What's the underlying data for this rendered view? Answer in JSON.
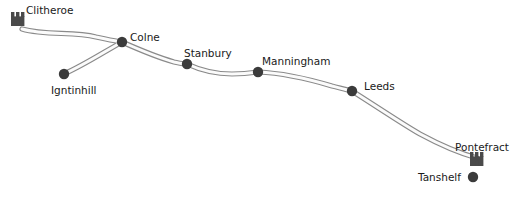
{
  "map": {
    "title": "Route map",
    "background_color": "#ffffff",
    "road_color": "#8a8a8a",
    "road_fill_color": "#fbfbfb",
    "node_color": "#3b3b3b",
    "label_color": "#1a1a1a",
    "castle_color": "#4a4a4a",
    "places": [
      {
        "id": "clitheroe",
        "label": "Clitheroe",
        "marker": "castle-icon",
        "x": 20,
        "y": 26,
        "label_x": 26,
        "label_y": 14
      },
      {
        "id": "colne",
        "label": "Colne",
        "marker": "node-dot",
        "x": 122,
        "y": 42,
        "label_x": 130,
        "label_y": 41
      },
      {
        "id": "igntinhill",
        "label": "Igntinhill",
        "marker": "node-dot",
        "x": 64,
        "y": 74,
        "label_x": 51,
        "label_y": 94
      },
      {
        "id": "stanbury",
        "label": "Stanbury",
        "marker": "node-dot",
        "x": 187,
        "y": 64,
        "label_x": 184,
        "label_y": 57
      },
      {
        "id": "manningham",
        "label": "Manningham",
        "marker": "node-dot",
        "x": 258,
        "y": 72,
        "label_x": 262,
        "label_y": 65
      },
      {
        "id": "leeds",
        "label": "Leeds",
        "marker": "node-dot",
        "x": 352,
        "y": 91,
        "label_x": 364,
        "label_y": 90
      },
      {
        "id": "pontefract",
        "label": "Pontefract",
        "marker": "castle-icon",
        "x": 478,
        "y": 159,
        "label_x": 455,
        "label_y": 151
      },
      {
        "id": "tanshelf",
        "label": "Tanshelf",
        "marker": "node-dot",
        "x": 473,
        "y": 177,
        "label_x": 418,
        "label_y": 180
      }
    ],
    "roads": [
      {
        "id": "clitheroe-colne",
        "from": "clitheroe",
        "to": "colne",
        "path": "M 22 29 C 46 36, 74 31, 96 37 C 106 39, 114 41, 122 42"
      },
      {
        "id": "igntinhill-colne",
        "from": "igntinhill",
        "to": "colne",
        "path": "M 64 74 C 84 65, 104 52, 122 42"
      },
      {
        "id": "colne-stanbury",
        "from": "colne",
        "to": "stanbury",
        "path": "M 122 42 C 140 50, 160 58, 174 62 C 179 63, 183 64, 187 64"
      },
      {
        "id": "stanbury-manningham",
        "from": "stanbury",
        "to": "manningham",
        "path": "M 187 64 C 200 70, 216 74, 232 74 C 243 74, 251 73, 258 72"
      },
      {
        "id": "manningham-leeds",
        "from": "manningham",
        "to": "leeds",
        "path": "M 258 72 C 282 73, 312 80, 332 86 C 340 88, 347 90, 352 91"
      },
      {
        "id": "leeds-pontefract",
        "from": "leeds",
        "to": "pontefract",
        "path": "M 352 91 C 382 110, 404 125, 420 134 C 444 147, 466 155, 477 158"
      }
    ]
  }
}
